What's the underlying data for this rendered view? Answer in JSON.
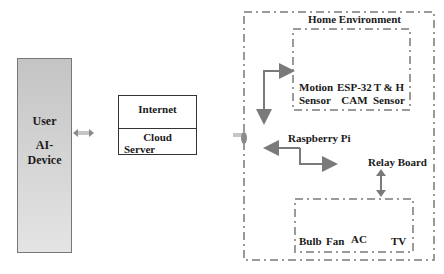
{
  "user_block": {
    "line1": "User",
    "line2": "AI-",
    "line3": "Device"
  },
  "cloud_block": {
    "internet": "Internet",
    "cloud_line1": "Cloud",
    "cloud_line2": "Server"
  },
  "home": {
    "title": "Home Environment",
    "sensors": [
      {
        "line1": "Motion",
        "line2": "Sensor"
      },
      {
        "line1": "ESP-32",
        "line2": "CAM"
      },
      {
        "line1": "T & H",
        "line2": "Sensor"
      }
    ],
    "controller": "Raspberry Pi",
    "relay": "Relay Board",
    "appliances": [
      "Bulb",
      "Fan",
      "AC",
      "TV"
    ]
  },
  "colors": {
    "arrow": "#7a7a7a",
    "dash": "#9a9a9a",
    "user_fill_top": "#c4c4c4",
    "user_fill_bottom": "#e4e4e4"
  }
}
